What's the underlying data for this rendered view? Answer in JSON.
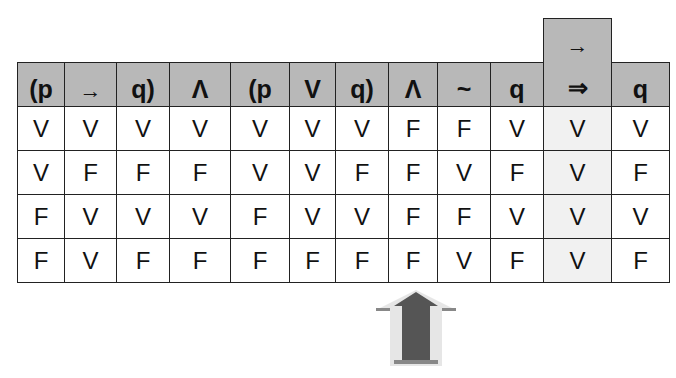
{
  "table": {
    "headers": [
      "(p",
      "→",
      "q)",
      "Λ",
      "(p",
      "V",
      "q)",
      "Λ",
      "~",
      "q",
      "⇒",
      "q"
    ],
    "conclusion_column": {
      "index": 10,
      "top_label": "→",
      "bottom_label": "⇒"
    },
    "rows": [
      [
        "V",
        "V",
        "V",
        "V",
        "V",
        "V",
        "V",
        "F",
        "F",
        "V",
        "V",
        "V"
      ],
      [
        "V",
        "F",
        "F",
        "F",
        "V",
        "V",
        "F",
        "F",
        "V",
        "F",
        "V",
        "F"
      ],
      [
        "F",
        "V",
        "V",
        "V",
        "F",
        "V",
        "V",
        "F",
        "F",
        "V",
        "V",
        "V"
      ],
      [
        "F",
        "V",
        "F",
        "F",
        "F",
        "F",
        "F",
        "F",
        "V",
        "F",
        "V",
        "F"
      ]
    ]
  },
  "annotation": {
    "icon": "up-arrow-icon",
    "points_to_column": 7
  },
  "colors": {
    "header_bg": "#b8b8b8",
    "highlight_bg": "#f1f1f1",
    "arrow": "#555555",
    "border": "#222222"
  }
}
